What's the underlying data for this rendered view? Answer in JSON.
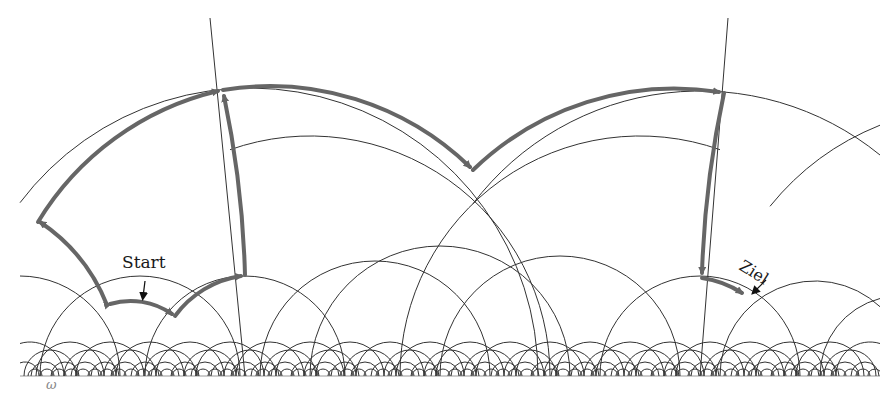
{
  "figure": {
    "labels": {
      "start": "Start",
      "goal": "Ziel",
      "boundary_point": "ω"
    },
    "colors": {
      "background": "#ffffff",
      "grid_line": "#333333",
      "path": "#666666",
      "pointer_arrow": "#111111",
      "baseline": "#bbbbbb"
    },
    "baseline_y": 376
  }
}
